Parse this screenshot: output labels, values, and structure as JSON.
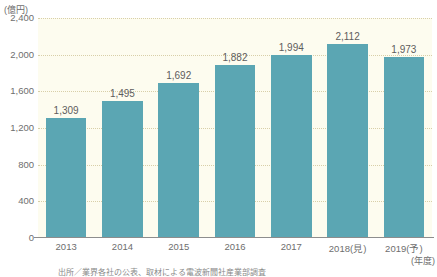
{
  "chart_data": {
    "type": "bar",
    "title": "",
    "subtitle": "",
    "xlabel": "(年度)",
    "ylabel": "(億円)",
    "categories": [
      "2013",
      "2014",
      "2015",
      "2016",
      "2017",
      "2018(見)",
      "2019(予)"
    ],
    "values": [
      1309,
      1495,
      1692,
      1882,
      1994,
      2112,
      1973
    ],
    "value_labels": [
      "1,309",
      "1,495",
      "1,692",
      "1,882",
      "1,994",
      "2,112",
      "1,973"
    ],
    "ylim": [
      0,
      2400
    ],
    "yticks": [
      0,
      400,
      800,
      1200,
      1600,
      2000,
      2400
    ],
    "ytick_labels": [
      "0",
      "400",
      "800",
      "1,200",
      "1,600",
      "2,000",
      "2,400"
    ],
    "grid": "horizontal-dotted",
    "legend": "none",
    "series": [
      {
        "name": "",
        "values": [
          1309,
          1495,
          1692,
          1882,
          1994,
          2112,
          1973
        ],
        "color": "#5ba6b3"
      }
    ]
  },
  "axes": {
    "y_unit_label": "(億円)",
    "x_unit_label": "(年度)"
  },
  "colors": {
    "bar": "#5ba6b3",
    "plot_background": "#fdfcef",
    "gridline": "#d8cfa8",
    "axis_line": "#8d8d8d",
    "text": "#6e6e6e"
  },
  "footer": {
    "source_note": "出所／業界各社の公表、取材による電波新聞社産業部調査"
  }
}
